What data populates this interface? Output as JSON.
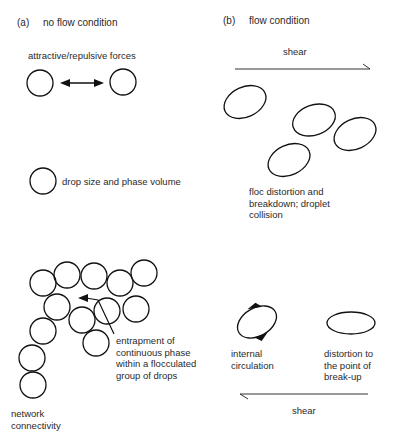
{
  "panels": {
    "a": {
      "letter": "(a)",
      "title": "no flow condition",
      "labels": {
        "forces": "attractive/repulsive forces",
        "drop_size": "drop size and phase volume",
        "entrapment": [
          "entrapment of",
          "continuous phase",
          "within a flocculated",
          "group of drops"
        ],
        "network": [
          "network",
          "connectivity"
        ]
      }
    },
    "b": {
      "letter": "(b)",
      "title": "flow condition",
      "labels": {
        "shear_top": "shear",
        "floc": [
          "floc distortion and",
          "breakdown;  droplet",
          "collision"
        ],
        "internal": [
          "internal",
          "circulation"
        ],
        "distortion": [
          "distortion to",
          "the point of",
          "break-up"
        ],
        "shear_bottom": "shear"
      }
    }
  },
  "colors": {
    "stroke": "#111111",
    "text": "#2a2a2a",
    "background": "#ffffff"
  }
}
